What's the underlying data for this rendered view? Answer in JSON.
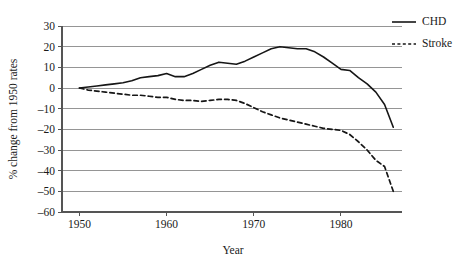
{
  "chart_data": {
    "type": "line",
    "title": "",
    "xlabel": "Year",
    "ylabel": "% change from 1950 rates",
    "xlim": [
      1948,
      1987
    ],
    "ylim": [
      -60,
      30
    ],
    "xticks": [
      1950,
      1960,
      1970,
      1980
    ],
    "xtick_labels": [
      "1950",
      "1960",
      "1970",
      "1980"
    ],
    "yticks": [
      30,
      20,
      10,
      0,
      -10,
      -20,
      -30,
      -40,
      -50,
      -60
    ],
    "ytick_labels": [
      "30",
      "20",
      "10",
      "0",
      "–10",
      "–20",
      "–30",
      "–40",
      "–50",
      "–60"
    ],
    "grid": true,
    "grid_axis": "y",
    "legend_position": "top-right",
    "series": [
      {
        "name": "CHD",
        "style": "solid",
        "color": "#161616",
        "x": [
          1950,
          1951,
          1952,
          1953,
          1954,
          1955,
          1956,
          1957,
          1958,
          1959,
          1960,
          1961,
          1962,
          1963,
          1964,
          1965,
          1966,
          1967,
          1968,
          1969,
          1970,
          1971,
          1972,
          1973,
          1974,
          1975,
          1976,
          1977,
          1978,
          1979,
          1980,
          1981,
          1982,
          1983,
          1984,
          1985,
          1986
        ],
        "values": [
          0,
          0.5,
          1,
          1.5,
          2,
          2.5,
          3.5,
          5,
          5.5,
          6,
          7,
          5.5,
          5.5,
          7,
          9,
          11,
          12.5,
          12,
          11.5,
          13,
          15,
          17,
          19,
          20,
          19.5,
          19,
          19,
          17.5,
          15,
          12,
          9,
          8.5,
          5,
          2,
          -2,
          -8,
          -19
        ]
      },
      {
        "name": "Stroke",
        "style": "dotted",
        "color": "#161616",
        "x": [
          1950,
          1951,
          1952,
          1953,
          1954,
          1955,
          1956,
          1957,
          1958,
          1959,
          1960,
          1961,
          1962,
          1963,
          1964,
          1965,
          1966,
          1967,
          1968,
          1969,
          1970,
          1971,
          1972,
          1973,
          1974,
          1975,
          1976,
          1977,
          1978,
          1979,
          1980,
          1981,
          1982,
          1983,
          1984,
          1985,
          1986
        ],
        "values": [
          0,
          -1,
          -1.5,
          -2,
          -2.5,
          -3,
          -3.5,
          -3.5,
          -4,
          -4.5,
          -4.5,
          -5.5,
          -6,
          -6,
          -6.5,
          -6,
          -5.5,
          -5.5,
          -6,
          -7.5,
          -9.5,
          -11.5,
          -13,
          -14.5,
          -15.5,
          -16.5,
          -17.5,
          -18.5,
          -19.5,
          -20,
          -20.5,
          -22.5,
          -26,
          -30,
          -35,
          -38,
          -50
        ]
      }
    ]
  },
  "legend": {
    "items": [
      {
        "label": "CHD"
      },
      {
        "label": "Stroke"
      }
    ]
  }
}
